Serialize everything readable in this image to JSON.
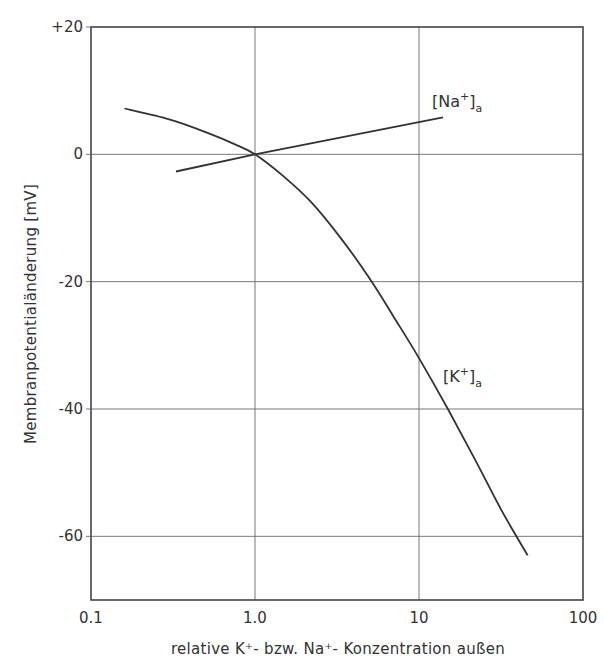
{
  "chart_data": {
    "type": "line",
    "title": "",
    "xlabel": "relative K⁺- bzw. Na⁺- Konzentration außen",
    "ylabel": "Membranpotentialänderung  [mV]",
    "xscale": "log",
    "xlim": [
      0.1,
      100
    ],
    "ylim": [
      -70,
      20
    ],
    "x_ticks": [
      0.1,
      1.0,
      10,
      100
    ],
    "x_tick_labels": [
      "0.1",
      "1.0",
      "10",
      "100"
    ],
    "y_ticks": [
      20,
      0,
      -20,
      -40,
      -60
    ],
    "y_tick_labels": [
      "+20",
      "0",
      "-20",
      "-40",
      "-60"
    ],
    "grid": true,
    "legend": "inline labels",
    "series": [
      {
        "name": "[K⁺]a",
        "label_main": "[K",
        "label_sup": "+",
        "label_close": "]",
        "label_sub": "a",
        "x": [
          0.16,
          0.3,
          0.5,
          0.75,
          1.0,
          1.5,
          2.2,
          3.3,
          5.0,
          7.0,
          10,
          15,
          22,
          32,
          46
        ],
        "y": [
          7.2,
          5.5,
          3.5,
          1.6,
          0,
          -3.5,
          -7.5,
          -13,
          -19.5,
          -25.5,
          -32,
          -40,
          -48,
          -56,
          -63
        ]
      },
      {
        "name": "[Na⁺]a",
        "label_main": "[Na",
        "label_sup": "+",
        "label_close": "]",
        "label_sub": "a",
        "x": [
          0.33,
          1.0,
          14
        ],
        "y": [
          -2.7,
          0,
          5.8
        ]
      }
    ]
  }
}
